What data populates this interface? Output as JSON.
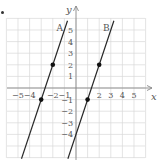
{
  "chart_data": {
    "type": "line",
    "title": "",
    "xlabel": "x",
    "ylabel": "y",
    "xlim": [
      -6,
      6
    ],
    "ylim": [
      -6,
      6
    ],
    "grid": true,
    "x_tick_labels": [
      "−5",
      "−4",
      "−2",
      "−1",
      "2",
      "3",
      "4",
      "5"
    ],
    "x_ticks": [
      -5,
      -4,
      -2,
      -1,
      2,
      3,
      4,
      5
    ],
    "y_tick_labels": [
      "5",
      "4",
      "3",
      "2",
      "1",
      "−1",
      "−2",
      "−3",
      "−4"
    ],
    "y_ticks": [
      5,
      4,
      3,
      2,
      1,
      -1,
      -2,
      -3,
      -4
    ],
    "series": [
      {
        "name": "A",
        "equation": "y = 3x + 8",
        "slope": 3,
        "intercept": 8,
        "points": [
          [
            -3,
            -1
          ],
          [
            -2,
            2
          ]
        ]
      },
      {
        "name": "B",
        "equation": "y = 3x - 4",
        "slope": 3,
        "intercept": -4,
        "points": [
          [
            1,
            -1
          ],
          [
            2,
            2
          ]
        ]
      }
    ]
  },
  "colors": {
    "grid": "#d8d8d8",
    "axis": "#888888",
    "line": "#2a2a2a",
    "text": "#555555"
  }
}
